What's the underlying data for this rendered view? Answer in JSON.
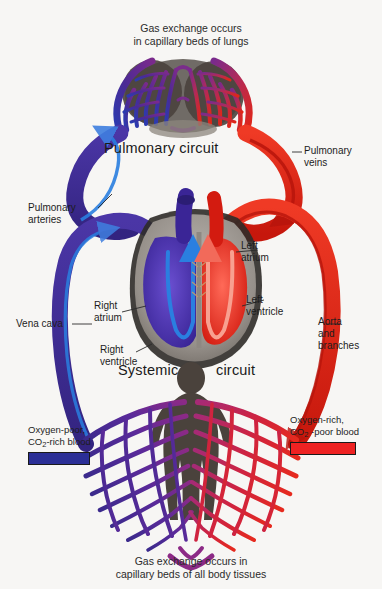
{
  "figure": {
    "background_color": "#f7f6f4"
  },
  "captions": {
    "top_line1": "Gas exchange occurs",
    "top_line2": "in capillary beds of lungs",
    "bottom_line1": "Gas exchange occurs in",
    "bottom_line2": "capillary beds of all body tissues"
  },
  "circuits": {
    "pulmonary": "Pulmonary circuit",
    "systemic_left": "Systemic",
    "systemic_right": "circuit"
  },
  "labels": {
    "pulmonary_veins": "Pulmonary\nveins",
    "pulmonary_arteries": "Pulmonary\narteries",
    "vena_cava": "Vena cava",
    "right_atrium": "Right\natrium",
    "right_ventricle": "Right\nventricle",
    "left_atrium": "Left\natrium",
    "left_ventricle": "Left\nventricle",
    "aorta": "Aorta\nand\nbranches"
  },
  "legend": {
    "deoxygenated": {
      "line1": "Oxygen-poor,",
      "line2_pre": "CO",
      "line2_sub": "2",
      "line2_post": "-rich blood",
      "color": "#2b2f96"
    },
    "oxygenated": {
      "line1": "Oxygen-rich,",
      "line2_pre": "CO",
      "line2_sub": "2",
      "line2_post": " -poor blood",
      "color": "#ee2222"
    }
  },
  "colors": {
    "vein_dark": "#3b2a8c",
    "vein_mid": "#4a2f9e",
    "artery_bright": "#e02617",
    "artery_dark": "#b8150c",
    "capillary_purple": "#7b2a8e",
    "capillary_magenta": "#b3247a",
    "myocardium_gray": "#9a9590",
    "myocardium_dark": "#2e2b28",
    "body_silhouette": "#4a423c",
    "arrow_blue": "#2a7fe0",
    "arrow_red": "#f26a5a",
    "label_text": "#1d1d1d"
  }
}
